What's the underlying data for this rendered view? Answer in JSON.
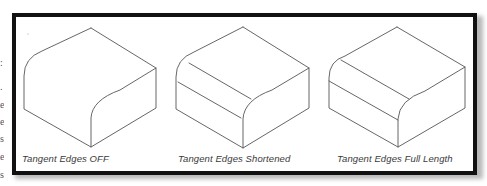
{
  "figure": {
    "panels": [
      {
        "id": "off",
        "label": "Tangent Edges OFF"
      },
      {
        "id": "shortened",
        "label": "Tangent Edges Shortened"
      },
      {
        "id": "full",
        "label": "Tangent Edges Full Length"
      }
    ]
  },
  "colors": {
    "frame": "#111111",
    "lines": "#555555",
    "label_text": "#3a3a3a"
  },
  "margin_fragments": [
    ":",
    ".",
    "e",
    "e",
    "s",
    "e",
    "s"
  ]
}
